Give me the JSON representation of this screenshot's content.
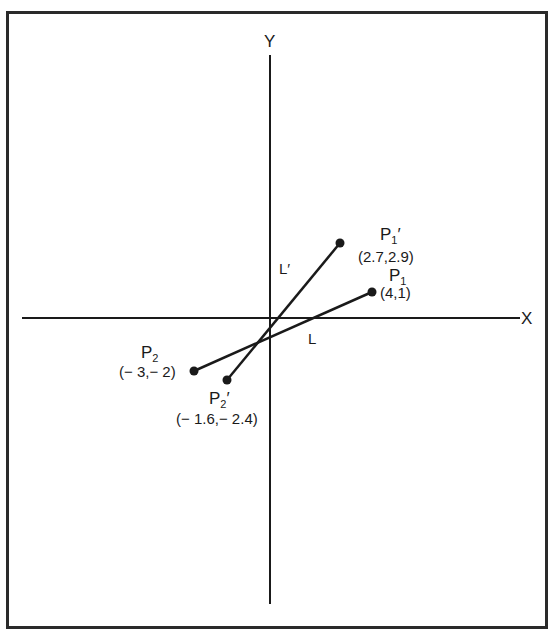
{
  "diagram": {
    "axes": {
      "x_label": "X",
      "y_label": "Y"
    },
    "points": {
      "P1": {
        "name": "P",
        "sub": "1",
        "prime": "",
        "coords": "(4,1)",
        "x": 4,
        "y": 1
      },
      "P2": {
        "name": "P",
        "sub": "2",
        "prime": "",
        "coords": "(− 3,− 2)",
        "x": -3,
        "y": -2
      },
      "P1p": {
        "name": "P",
        "sub": "1",
        "prime": "′",
        "coords": "(2.7,2.9)",
        "x": 2.7,
        "y": 2.9
      },
      "P2p": {
        "name": "P",
        "sub": "2",
        "prime": "′",
        "coords": "(− 1.6,− 2.4)",
        "x": -1.6,
        "y": -2.4
      }
    },
    "lines": {
      "L": {
        "label": "L",
        "from": "P2",
        "to": "P1"
      },
      "Lp": {
        "label": "L′",
        "from": "P2p",
        "to": "P1p"
      }
    },
    "colors": {
      "ink": "#1a1a1a",
      "frame": "#2a2a2a",
      "background": "#ffffff"
    }
  }
}
